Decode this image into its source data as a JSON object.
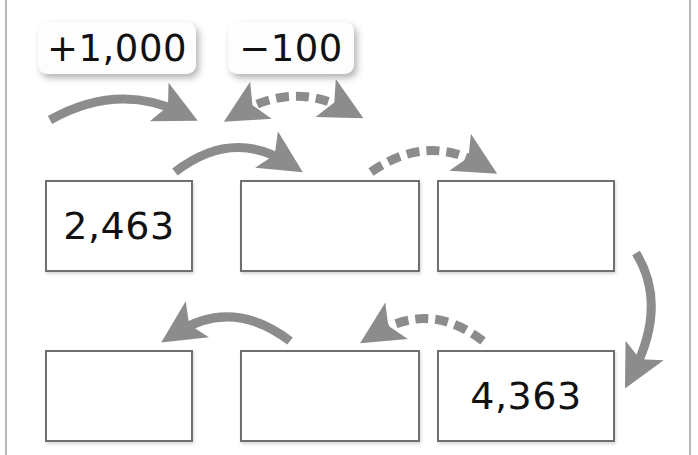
{
  "worksheet": {
    "type": "number-chain-puzzle",
    "legend": [
      {
        "id": "add",
        "label": "+1,000",
        "operation": "add",
        "amount": 1000,
        "line_style": "solid",
        "arrow_color": "#8c8c8c"
      },
      {
        "id": "subtract",
        "label": "−100",
        "operation": "subtract",
        "amount": 100,
        "line_style": "dashed",
        "arrow_color": "#8c8c8c"
      }
    ],
    "grid": {
      "rows": 2,
      "cols": 3,
      "cells": [
        {
          "id": "cell-1",
          "row": 1,
          "col": 1,
          "value": "2,463",
          "filled": true
        },
        {
          "id": "cell-2",
          "row": 1,
          "col": 2,
          "value": "",
          "filled": false
        },
        {
          "id": "cell-3",
          "row": 1,
          "col": 3,
          "value": "",
          "filled": false
        },
        {
          "id": "cell-4",
          "row": 2,
          "col": 1,
          "value": "",
          "filled": false
        },
        {
          "id": "cell-5",
          "row": 2,
          "col": 2,
          "value": "",
          "filled": false
        },
        {
          "id": "cell-6",
          "row": 2,
          "col": 3,
          "value": "4,363",
          "filled": true
        }
      ]
    },
    "arrows": [
      {
        "id": "arrow-legend-add",
        "from": "legend-add",
        "to": "",
        "style": "solid",
        "direction": "right"
      },
      {
        "id": "arrow-legend-sub",
        "from": "legend-sub",
        "to": "",
        "style": "dashed",
        "direction": "right"
      },
      {
        "id": "arrow-1-2",
        "from": "cell-1",
        "to": "cell-2",
        "style": "solid",
        "direction": "right"
      },
      {
        "id": "arrow-2-3",
        "from": "cell-2",
        "to": "cell-3",
        "style": "dashed",
        "direction": "right"
      },
      {
        "id": "arrow-3-6",
        "from": "cell-3",
        "to": "cell-6",
        "style": "solid",
        "direction": "down"
      },
      {
        "id": "arrow-6-5",
        "from": "cell-6",
        "to": "cell-5",
        "style": "dashed",
        "direction": "left"
      },
      {
        "id": "arrow-5-4",
        "from": "cell-5",
        "to": "cell-4",
        "style": "solid",
        "direction": "left"
      }
    ],
    "colors": {
      "box_border": "#6f6f6f",
      "arrow": "#8c8c8c",
      "text": "#111111",
      "page_rule": "#b9b9b9"
    }
  }
}
